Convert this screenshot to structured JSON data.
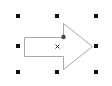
{
  "shape": {
    "type": "right-arrow",
    "selected": true,
    "stroke_color": "#a0a0a0",
    "fill_color": "#ffffff",
    "points": [
      [
        24,
        37
      ],
      [
        63,
        37
      ],
      [
        63,
        23
      ],
      [
        92,
        46
      ],
      [
        63,
        70
      ],
      [
        63,
        56
      ],
      [
        24,
        56
      ]
    ]
  },
  "selection": {
    "handle_color": "#111111",
    "handles": [
      {
        "name": "top-left",
        "x": 17,
        "y": 15
      },
      {
        "name": "top-center",
        "x": 56,
        "y": 15
      },
      {
        "name": "top-right",
        "x": 95,
        "y": 15
      },
      {
        "name": "middle-left",
        "x": 17,
        "y": 45
      },
      {
        "name": "middle-right",
        "x": 95,
        "y": 45
      },
      {
        "name": "bottom-left",
        "x": 17,
        "y": 71
      },
      {
        "name": "bottom-center",
        "x": 56,
        "y": 71
      },
      {
        "name": "bottom-right",
        "x": 95,
        "y": 71
      }
    ],
    "center_marker": {
      "glyph": "×",
      "x": 57,
      "y": 46
    },
    "adjust_handle": {
      "x": 63,
      "y": 37
    }
  }
}
